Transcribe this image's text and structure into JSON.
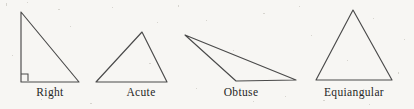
{
  "figure": {
    "background_color": "#f7f6f3",
    "stroke_color": "#4a4a4a",
    "label_color": "#262626",
    "canvas": {
      "width": 414,
      "height": 109
    }
  },
  "chart_data": {
    "type": "diagram",
    "xlabel": "",
    "ylabel": "",
    "grid": false,
    "legend_position": "none",
    "items": [
      {
        "label": "Right",
        "icon": "right-triangle-icon",
        "vertices": [
          [
            21,
            12
          ],
          [
            21,
            82
          ],
          [
            79,
            82
          ]
        ],
        "angle_marker": "square",
        "angle_marker_rect": [
          21,
          74,
          7,
          7
        ],
        "label_center_x": 50
      },
      {
        "label": "Acute",
        "icon": "acute-triangle-icon",
        "vertices": [
          [
            142,
            32
          ],
          [
            96,
            82
          ],
          [
            167,
            82
          ]
        ],
        "angle_marker": "none",
        "label_center_x": 141
      },
      {
        "label": "Obtuse",
        "icon": "obtuse-triangle-icon",
        "vertices": [
          [
            185,
            35
          ],
          [
            236,
            81
          ],
          [
            296,
            80
          ]
        ],
        "angle_marker": "none",
        "label_center_x": 241
      },
      {
        "label": "Equiangular",
        "icon": "equiangular-triangle-icon",
        "vertices": [
          [
            353,
            10
          ],
          [
            316,
            80
          ],
          [
            392,
            80
          ]
        ],
        "angle_marker": "none",
        "label_center_x": 354
      }
    ]
  },
  "labels": {
    "right": "Right",
    "acute": "Acute",
    "obtuse": "Obtuse",
    "equiangular": "Equiangular"
  }
}
